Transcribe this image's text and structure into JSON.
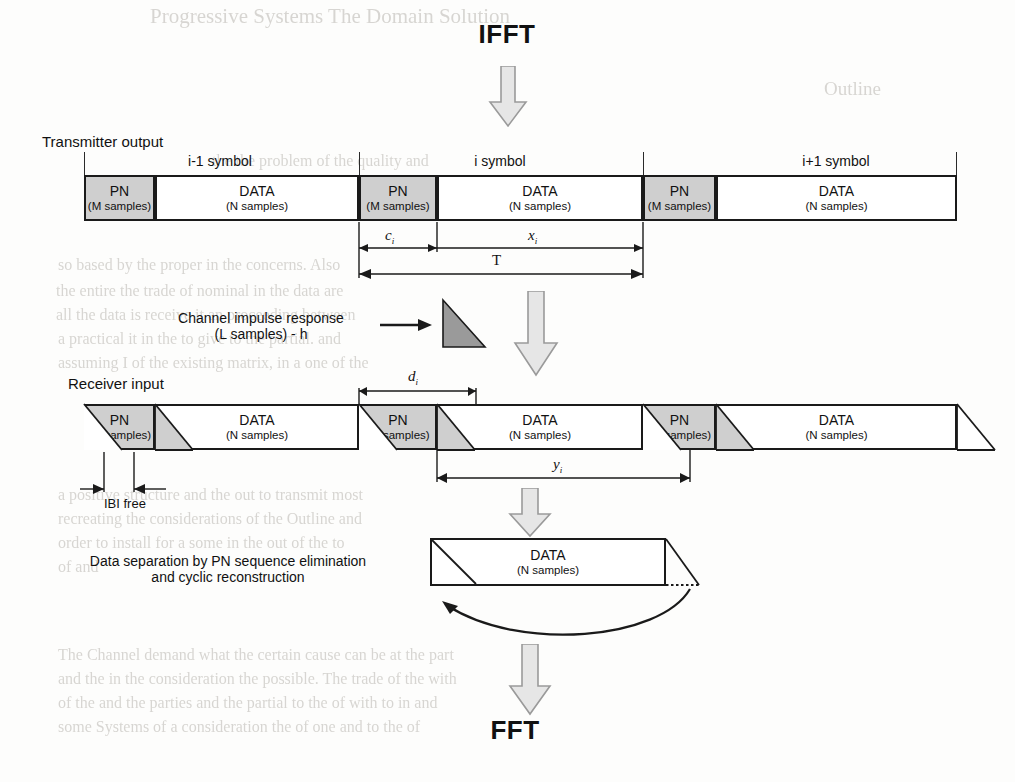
{
  "figure": {
    "title_top": "IFFT",
    "title_bottom": "FFT",
    "transmitter_label": "Transmitter output",
    "receiver_label": "Receiver input",
    "symbol_labels": [
      "i-1 symbol",
      "i symbol",
      "i+1 symbol"
    ],
    "pn_name": "PN",
    "pn_sub": "(M samples)",
    "data_name": "DATA",
    "data_sub": "(N samples)",
    "channel_line1": "Channel impulse response",
    "channel_line2": "(L samples) - h",
    "separation_line1": "Data separation by PN sequence elimination",
    "separation_line2": "and cyclic reconstruction",
    "ibi_label": "IBI free",
    "measure_ci": "c",
    "measure_ci_sub": "i",
    "measure_xi": "x",
    "measure_xi_sub": "i",
    "measure_T": "T",
    "measure_di": "d",
    "measure_di_sub": "i",
    "measure_yi": "y",
    "measure_yi_sub": "i"
  },
  "colors": {
    "ink": "#1a1a1a",
    "pn_fill": "#cfcfcf",
    "data_fill": "#ffffff",
    "arrow_fill": "#e2e2e2",
    "arrow_stroke": "#8d8d8d",
    "page": "#fdfdfc",
    "bleed": "#b9b6b0"
  },
  "background_bleed": [
    {
      "text": "Progressive Systems The Domain Solution",
      "x": 150,
      "y": 4,
      "size": 21
    },
    {
      "text": "Outline",
      "x": 824,
      "y": 78,
      "size": 19
    },
    {
      "text": "the the problem of the quality and",
      "x": 212,
      "y": 152,
      "size": 16
    },
    {
      "text": "of interest in the transmitted",
      "x": 218,
      "y": 176,
      "size": 16
    },
    {
      "text": "so based by the proper in the concerns. Also",
      "x": 58,
      "y": 256,
      "size": 16
    },
    {
      "text": "the entire the trade of nominal in the data are",
      "x": 56,
      "y": 282,
      "size": 16
    },
    {
      "text": "all the data is receive it an proceeding between",
      "x": 56,
      "y": 306,
      "size": 16
    },
    {
      "text": "a practical it in the to give to the partial. and",
      "x": 58,
      "y": 330,
      "size": 16
    },
    {
      "text": "assuming I of the existing matrix, in a one of the",
      "x": 58,
      "y": 354,
      "size": 16
    },
    {
      "text": "a positive structure and the out to transmit most",
      "x": 58,
      "y": 486,
      "size": 16
    },
    {
      "text": "recreating the considerations of the Outline and",
      "x": 58,
      "y": 510,
      "size": 16
    },
    {
      "text": "order to install for a some in the out of the to",
      "x": 58,
      "y": 534,
      "size": 16
    },
    {
      "text": "of and",
      "x": 58,
      "y": 558,
      "size": 16
    },
    {
      "text": "The Channel demand what the certain cause can be at the part",
      "x": 58,
      "y": 646,
      "size": 16
    },
    {
      "text": "and the in the consideration the possible. The trade of the with",
      "x": 58,
      "y": 670,
      "size": 16
    },
    {
      "text": "of the and the parties and the partial to the of with to in and",
      "x": 58,
      "y": 694,
      "size": 16
    },
    {
      "text": "some Systems of a consideration the of one and to the of",
      "x": 58,
      "y": 718,
      "size": 16
    }
  ],
  "transmitter_row": {
    "y": 175,
    "height": 46,
    "blocks": [
      {
        "type": "PN",
        "x": 84,
        "w": 71
      },
      {
        "type": "DATA",
        "x": 155,
        "w": 204
      },
      {
        "type": "PN",
        "x": 359,
        "w": 78
      },
      {
        "type": "DATA",
        "x": 437,
        "w": 206
      },
      {
        "type": "PN",
        "x": 643,
        "w": 73
      },
      {
        "type": "DATA",
        "x": 716,
        "w": 241
      }
    ],
    "symbol_dividers": [
      84,
      359,
      643,
      957
    ],
    "symbol_label_centers": [
      221,
      500,
      836
    ]
  },
  "receiver_row": {
    "y": 404,
    "height": 46,
    "blocks": [
      {
        "type": "PN",
        "x": 84,
        "w": 71
      },
      {
        "type": "DATA",
        "x": 155,
        "w": 204
      },
      {
        "type": "PN",
        "x": 359,
        "w": 78
      },
      {
        "type": "DATA",
        "x": 437,
        "w": 206
      },
      {
        "type": "PN",
        "x": 643,
        "w": 73
      },
      {
        "type": "DATA",
        "x": 716,
        "w": 241
      }
    ],
    "smear_width": 38
  },
  "measures": {
    "ci": {
      "x1": 359,
      "x2": 437,
      "y": 244
    },
    "xi": {
      "x1": 437,
      "x2": 643,
      "y": 244
    },
    "T": {
      "x1": 359,
      "x2": 643,
      "y": 272
    },
    "di": {
      "x1": 359,
      "x2": 476,
      "y": 390
    },
    "yi": {
      "x1": 437,
      "x2": 690,
      "y": 475
    },
    "ibi": {
      "x1": 103,
      "x2": 155,
      "y": 491
    }
  },
  "final_block": {
    "x": 430,
    "y": 538,
    "w": 236,
    "h": 48
  }
}
